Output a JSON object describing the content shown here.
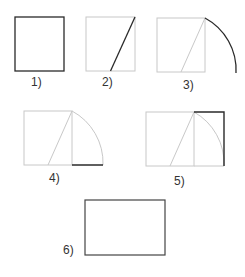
{
  "colors": {
    "light_line": "#c8c8c8",
    "dark_line": "#2a2a2a",
    "label": "#333333",
    "background": "#ffffff"
  },
  "steps": [
    {
      "label": "1)",
      "description": "Draw a square"
    },
    {
      "label": "2)",
      "description": "Draw a line from the midpoint of the base to an opposite corner"
    },
    {
      "label": "3)",
      "description": "Swing an arc using that line as the radius"
    },
    {
      "label": "4)",
      "description": "Extend the base to meet the arc"
    },
    {
      "label": "5)",
      "description": "Complete the rectangle"
    },
    {
      "label": "6)",
      "description": "Resulting golden rectangle"
    }
  ]
}
